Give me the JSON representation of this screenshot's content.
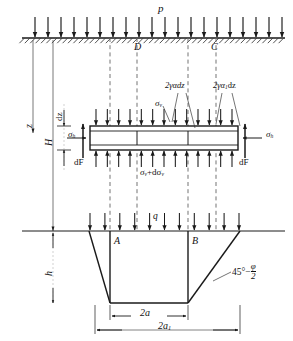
{
  "figure": {
    "type": "soil-mechanics-silo-pressure-diagram"
  },
  "labels": {
    "surcharge": "p",
    "depth_z": "z",
    "depth_H": "H",
    "element_thickness": "dz",
    "sigma_h_left": "σ",
    "sigma_h_left_sub": "h",
    "sigma_h_right": "σ",
    "sigma_h_right_sub": "h",
    "sigma_v_top": "σ",
    "sigma_v_top_sub": "v",
    "sigma_v_bottom_main": "σ",
    "sigma_v_bottom_sub": "v",
    "sigma_v_bottom_delta": "+dσ",
    "sigma_v_bottom_delta_sub": "v",
    "friction_left": "2γαdz",
    "friction_right_pre": "2γα",
    "friction_right_sub": "1",
    "friction_right_post": "dz",
    "dF_left": "dF",
    "dF_right": "dF",
    "point_D": "D",
    "point_C": "C",
    "point_A": "A",
    "point_B": "B",
    "load_q": "q",
    "wedge_height": "h",
    "width_inner": "2a",
    "width_outer_pre": "2a",
    "width_outer_sub": "1",
    "angle_pre": "45°−",
    "angle_num": "φ",
    "angle_den": "2"
  },
  "colors": {
    "ink": "#1a1a1a",
    "line": "#2b2b2b",
    "dashed": "#6b6b6b",
    "element_fill": "#ffffff",
    "background": "#ffffff"
  },
  "geometry": {
    "ground_y": 38,
    "element_top_y": 126,
    "element_bottom_y": 150,
    "footing_y": 231,
    "wedge_base_y": 303,
    "dash_x": [
      110,
      137,
      188,
      216
    ],
    "element_left_x": 90,
    "element_right_x": 238,
    "wedge_inner_left_x": 110,
    "wedge_inner_right_x": 188,
    "wedge_outer_left_x": 89,
    "wedge_outer_right_x": 240,
    "surface_arrow_count": 20,
    "element_top_arrow_count": 13,
    "element_bottom_arrow_count": 13,
    "footing_arrow_count": 11
  }
}
